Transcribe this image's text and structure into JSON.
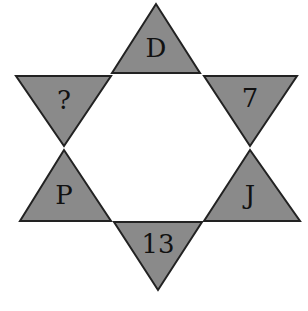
{
  "puzzle": {
    "shape": "six-pointed star",
    "colors": {
      "triangle_fill": "#8a8a8a",
      "triangle_stroke": "#222222",
      "background": "#ffffff",
      "text": "#111111"
    },
    "triangles": [
      {
        "position": "top",
        "label": "D",
        "points": "156,4 112,73 200,73",
        "label_x": 156,
        "label_y": 48
      },
      {
        "position": "upper-right",
        "label": "7",
        "points": "204,76 297,76 250,146",
        "label_x": 250,
        "label_y": 98
      },
      {
        "position": "lower-right",
        "label": "J",
        "points": "250,150 204,221 300,221",
        "label_x": 250,
        "label_y": 195
      },
      {
        "position": "bottom",
        "label": "13",
        "points": "114,222 202,222 158,290",
        "label_x": 158,
        "label_y": 244
      },
      {
        "position": "lower-left",
        "label": "P",
        "points": "64,150 20,221 111,221",
        "label_x": 64,
        "label_y": 195
      },
      {
        "position": "upper-left",
        "label": "?",
        "points": "16,76 111,76 64,146",
        "label_x": 64,
        "label_y": 100
      }
    ]
  }
}
